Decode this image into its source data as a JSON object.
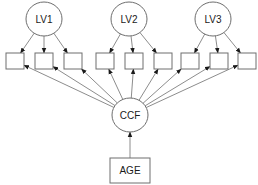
{
  "diagram": {
    "type": "path-diagram",
    "latent_variables": [
      {
        "id": "LV1",
        "label": "LV1",
        "cx": 44,
        "cy": 19
      },
      {
        "id": "LV2",
        "label": "LV2",
        "cx": 129,
        "cy": 19
      },
      {
        "id": "LV3",
        "label": "LV3",
        "cx": 213,
        "cy": 19
      }
    ],
    "indicators": [
      {
        "id": "i1",
        "x": 6,
        "parent": "LV1"
      },
      {
        "id": "i2",
        "x": 35,
        "parent": "LV1"
      },
      {
        "id": "i3",
        "x": 64,
        "parent": "LV1"
      },
      {
        "id": "i4",
        "x": 96,
        "parent": "LV2"
      },
      {
        "id": "i5",
        "x": 125,
        "parent": "LV2"
      },
      {
        "id": "i6",
        "x": 154,
        "parent": "LV2"
      },
      {
        "id": "i7",
        "x": 181,
        "parent": "LV3"
      },
      {
        "id": "i8",
        "x": 210,
        "parent": "LV3"
      },
      {
        "id": "i9",
        "x": 238,
        "parent": "LV3"
      }
    ],
    "common_factor": {
      "id": "CCF",
      "label": "CCF",
      "cx": 130,
      "cy": 115
    },
    "covariate": {
      "id": "AGE",
      "label": "AGE",
      "x": 110,
      "y": 158,
      "w": 40,
      "h": 25
    },
    "edges": [
      {
        "from": "LV1",
        "to": "i1"
      },
      {
        "from": "LV1",
        "to": "i2"
      },
      {
        "from": "LV1",
        "to": "i3"
      },
      {
        "from": "LV2",
        "to": "i4"
      },
      {
        "from": "LV2",
        "to": "i5"
      },
      {
        "from": "LV2",
        "to": "i6"
      },
      {
        "from": "LV3",
        "to": "i7"
      },
      {
        "from": "LV3",
        "to": "i8"
      },
      {
        "from": "LV3",
        "to": "i9"
      },
      {
        "from": "CCF",
        "to": "i1"
      },
      {
        "from": "CCF",
        "to": "i2"
      },
      {
        "from": "CCF",
        "to": "i3"
      },
      {
        "from": "CCF",
        "to": "i4"
      },
      {
        "from": "CCF",
        "to": "i5"
      },
      {
        "from": "CCF",
        "to": "i6"
      },
      {
        "from": "CCF",
        "to": "i7"
      },
      {
        "from": "CCF",
        "to": "i8"
      },
      {
        "from": "CCF",
        "to": "i9"
      },
      {
        "from": "AGE",
        "to": "CCF"
      }
    ],
    "colors": {
      "stroke": "#6e6e6e",
      "text": "#1a1a1a",
      "background": "#ffffff"
    }
  }
}
